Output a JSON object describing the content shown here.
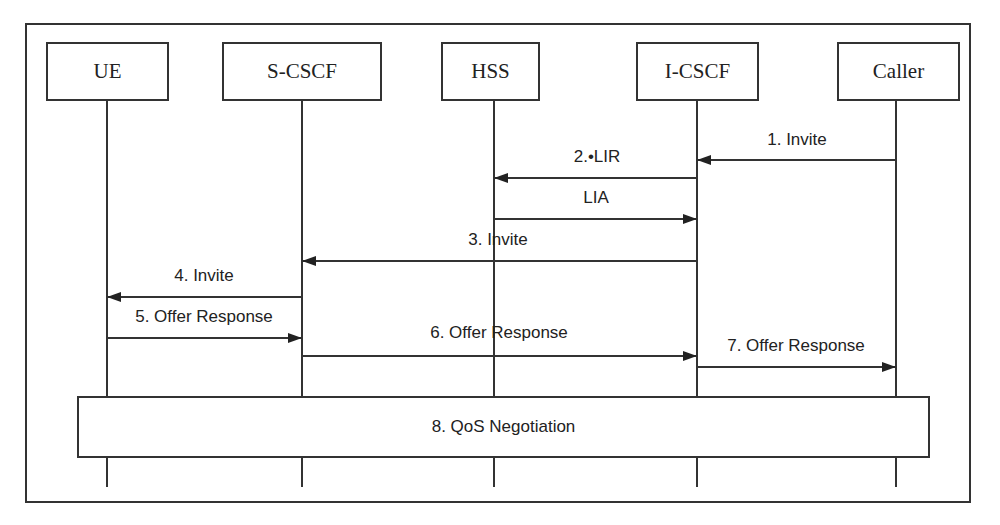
{
  "diagram": {
    "type": "sequence",
    "entities": [
      {
        "id": "ue",
        "label": "UE",
        "x": 107,
        "left": 46,
        "width": 123
      },
      {
        "id": "scscf",
        "label": "S-CSCF",
        "x": 302,
        "left": 222,
        "width": 160
      },
      {
        "id": "hss",
        "label": "HSS",
        "x": 494,
        "left": 441,
        "width": 99
      },
      {
        "id": "icscf",
        "label": "I-CSCF",
        "x": 697,
        "left": 636,
        "width": 123
      },
      {
        "id": "caller",
        "label": "Caller",
        "x": 896,
        "left": 837,
        "width": 123
      }
    ],
    "messages": [
      {
        "label": "1. Invite",
        "from": "caller",
        "to": "icscf",
        "y": 160,
        "label_x": 797,
        "label_y": 130
      },
      {
        "label": "2.•LIR",
        "from": "icscf",
        "to": "hss",
        "y": 178,
        "label_x": 595,
        "label_y": 147
      },
      {
        "label": "LIA",
        "from": "hss",
        "to": "icscf",
        "y": 219,
        "label_x": 595,
        "label_y": 188
      },
      {
        "label": "3. Invite",
        "from": "icscf",
        "to": "scscf",
        "y": 261,
        "label_x": 496,
        "label_y": 230
      },
      {
        "label": "4. Invite",
        "from": "scscf",
        "to": "ue",
        "y": 297,
        "label_x": 204,
        "label_y": 266
      },
      {
        "label": "5. Offer Response",
        "from": "ue",
        "to": "scscf",
        "y": 338,
        "label_x": 204,
        "label_y": 307
      },
      {
        "label": "6. Offer Response",
        "from": "scscf",
        "to": "icscf",
        "y": 356,
        "label_x": 499,
        "label_y": 323
      },
      {
        "label": "7. Offer Response",
        "from": "icscf",
        "to": "caller",
        "y": 367,
        "label_x": 796,
        "label_y": 336
      }
    ],
    "spanning_box": {
      "label": "8. QoS Negotiation"
    }
  }
}
